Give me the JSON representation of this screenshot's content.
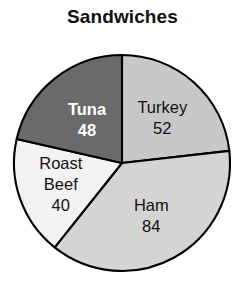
{
  "chart_data": {
    "type": "pie",
    "title": "Sandwiches",
    "subtitle": "",
    "xlabel": "",
    "ylabel": "",
    "legend": "none",
    "grid": false,
    "labels_inside_slices": true,
    "total": 224,
    "categories": [
      "Turkey",
      "Ham",
      "Roast Beef",
      "Tuna"
    ],
    "values": [
      52,
      84,
      40,
      48
    ],
    "slices": [
      {
        "name": "Turkey",
        "label": "Turkey",
        "value": 52,
        "value_text": "52",
        "color": "#c8c8c8",
        "text_color": "#111111",
        "bold": false,
        "start_angle_deg": 0.0,
        "end_angle_deg": 83.57,
        "percent": 23.2
      },
      {
        "name": "Ham",
        "label": "Ham",
        "value": 84,
        "value_text": "84",
        "color": "#d4d4d4",
        "text_color": "#111111",
        "bold": false,
        "start_angle_deg": 83.57,
        "end_angle_deg": 218.57,
        "percent": 37.5
      },
      {
        "name": "Roast Beef",
        "label": "Roast Beef",
        "label_line_1": "Roast",
        "label_line_2": "Beef",
        "value": 40,
        "value_text": "40",
        "color": "#f2f2f2",
        "text_color": "#111111",
        "bold": false,
        "start_angle_deg": 218.57,
        "end_angle_deg": 282.86,
        "percent": 17.9
      },
      {
        "name": "Tuna",
        "label": "Tuna",
        "value": 48,
        "value_text": "48",
        "color": "#6a6a6a",
        "text_color": "#ffffff",
        "bold": true,
        "start_angle_deg": 282.86,
        "end_angle_deg": 360.0,
        "percent": 21.4
      }
    ],
    "geometry": {
      "center_x": 122,
      "center_y": 163,
      "radius": 108,
      "start_at_twelve_oclock": true,
      "direction": "clockwise"
    },
    "style": {
      "background": "#ffffff",
      "outline": "#000000",
      "title_color": "#111111"
    }
  }
}
